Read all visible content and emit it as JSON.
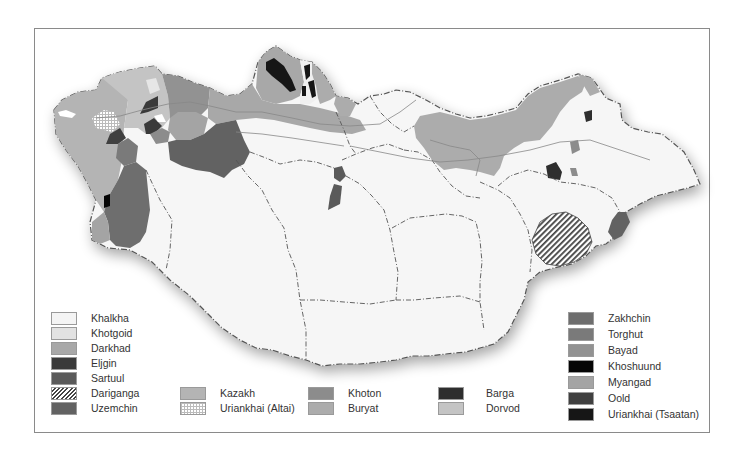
{
  "map": {
    "title": "Ethnic groups of Mongolia",
    "colors": {
      "khalkha": "#f4f4f4",
      "khotgoid": "#e2e2e2",
      "darkhad": "#a8a8a8",
      "eljgin": "#3a3a3a",
      "sartuul": "#5a5a5a",
      "uzemchin": "#626262",
      "kazakh": "#b4b4b4",
      "khoton": "#8c8c8c",
      "buryat": "#acacac",
      "barga": "#2e2e2e",
      "dorvod": "#c4c4c4",
      "zakhchin": "#6e6e6e",
      "torghut": "#7a7a7a",
      "bayad": "#929292",
      "khoshuund": "#050505",
      "myangad": "#a4a4a4",
      "oold": "#404040",
      "uriankhai_tsaatan": "#161616",
      "border": "#555555",
      "province_line": "#777777"
    }
  },
  "legend": {
    "col1": [
      {
        "label": "Khalkha",
        "key": "khalkha"
      },
      {
        "label": "Khotgoid",
        "key": "khotgoid"
      },
      {
        "label": "Darkhad",
        "key": "darkhad"
      },
      {
        "label": "Eljgin",
        "key": "eljgin"
      },
      {
        "label": "Sartuul",
        "key": "sartuul"
      },
      {
        "label": "Dariganga",
        "key": "dariganga",
        "pattern": "hatch"
      },
      {
        "label": "Uzemchin",
        "key": "uzemchin"
      }
    ],
    "col2": [
      {
        "label": "Kazakh",
        "key": "kazakh"
      },
      {
        "label": "Uriankhai (Altai)",
        "key": "uriankhai_altai",
        "pattern": "dots"
      }
    ],
    "col3": [
      {
        "label": "Khoton",
        "key": "khoton"
      },
      {
        "label": "Buryat",
        "key": "buryat"
      }
    ],
    "col4": [
      {
        "label": "Barga",
        "key": "barga"
      },
      {
        "label": "Dorvod",
        "key": "dorvod"
      }
    ],
    "col5": [
      {
        "label": "Zakhchin",
        "key": "zakhchin"
      },
      {
        "label": "Torghut",
        "key": "torghut"
      },
      {
        "label": "Bayad",
        "key": "bayad"
      },
      {
        "label": "Khoshuund",
        "key": "khoshuund"
      },
      {
        "label": "Myangad",
        "key": "myangad"
      },
      {
        "label": "Oold",
        "key": "oold"
      },
      {
        "label": "Uriankhai (Tsaatan)",
        "key": "uriankhai_tsaatan"
      }
    ]
  }
}
